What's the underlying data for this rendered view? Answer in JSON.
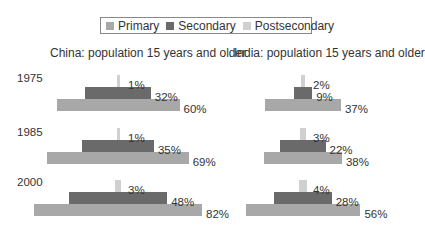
{
  "legend": {
    "items": [
      {
        "label": "Primary",
        "color": "#a8a8a8"
      },
      {
        "label": "Secondary",
        "color": "#6a6a6a"
      },
      {
        "label": "Postsecondary",
        "color": "#d0d0d0"
      }
    ]
  },
  "panels": [
    {
      "title": "China: population 15 years and older"
    },
    {
      "title": "India: population 15 years and older"
    }
  ],
  "years": [
    "1975",
    "1985",
    "2000"
  ],
  "chart_data": [
    {
      "type": "bar",
      "title": "China: population 15 years and older",
      "categories": [
        "1975",
        "1985",
        "2000"
      ],
      "series": [
        {
          "name": "Primary",
          "values": [
            60,
            69,
            82
          ],
          "labels": [
            "60%",
            "69%",
            "82%"
          ]
        },
        {
          "name": "Secondary",
          "values": [
            32,
            35,
            48
          ],
          "labels": [
            "32%",
            "35%",
            "48%"
          ]
        },
        {
          "name": "Postsecondary",
          "values": [
            1,
            1,
            3
          ],
          "labels": [
            "1%",
            "1%",
            "3%"
          ]
        }
      ],
      "xlabel": "",
      "ylabel": "",
      "grid": false,
      "legend_position": "top"
    },
    {
      "type": "bar",
      "title": "India: population 15 years and older",
      "categories": [
        "1975",
        "1985",
        "2000"
      ],
      "series": [
        {
          "name": "Primary",
          "values": [
            37,
            38,
            56
          ],
          "labels": [
            "37%",
            "38%",
            "56%"
          ]
        },
        {
          "name": "Secondary",
          "values": [
            9,
            22,
            28
          ],
          "labels": [
            "9%",
            "22%",
            "28%"
          ]
        },
        {
          "name": "Postsecondary",
          "values": [
            2,
            3,
            4
          ],
          "labels": [
            "2%",
            "3%",
            "4%"
          ]
        }
      ],
      "xlabel": "",
      "ylabel": "",
      "grid": false,
      "legend_position": "top"
    }
  ]
}
